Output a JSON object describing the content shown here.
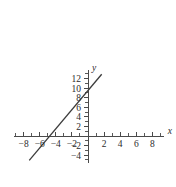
{
  "chart_data": {
    "type": "line",
    "title": "",
    "xlabel": "x",
    "ylabel": "y",
    "xlim": [
      -9.2,
      9.4
    ],
    "ylim": [
      -5.6,
      13.8
    ],
    "grid": false,
    "legend": null,
    "x_ticks_labeled": [
      -8,
      -6,
      -4,
      -2,
      2,
      4,
      6,
      8
    ],
    "x_tick_labels": [
      "−8",
      "−6",
      "−4",
      "−2",
      "2",
      "4",
      "6",
      "8"
    ],
    "y_ticks_labeled": [
      12,
      10,
      8,
      6,
      4,
      2,
      -2,
      -4
    ],
    "y_tick_labels": [
      "12",
      "10",
      "8",
      "6",
      "4",
      "2",
      "−2",
      "−4"
    ],
    "x_tick_step": 1,
    "y_tick_step": 1,
    "series": [
      {
        "name": "line",
        "type": "line",
        "slope": 2,
        "intercept": 9.5,
        "x_intercept": -5,
        "y_intercept": 9.5,
        "x": [
          -7.3,
          1.7
        ],
        "values": [
          -5.1,
          12.9
        ],
        "color": "#3c3c3c"
      }
    ],
    "axis_color": "#4a4a4a",
    "background": "#ffffff"
  }
}
